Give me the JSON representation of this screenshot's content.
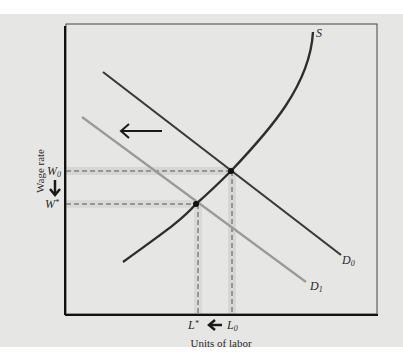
{
  "figure": {
    "type": "labor-market-diagram",
    "x_axis_label": "Units of labor",
    "y_axis_label": "Wage rate",
    "curves": [
      {
        "id": "S",
        "label": "S",
        "kind": "supply",
        "color": "#2e2e2e"
      },
      {
        "id": "D0",
        "label": "D",
        "subscript": "0",
        "kind": "demand-initial",
        "color": "#3a3a3a"
      },
      {
        "id": "D1",
        "label": "D",
        "subscript": "1",
        "kind": "demand-shifted",
        "color": "#9a9a9a"
      }
    ],
    "wage_labels": {
      "w0": {
        "base": "W",
        "sub": "0"
      },
      "wstar": {
        "base": "W",
        "sup": "*"
      }
    },
    "labor_labels": {
      "lstar": {
        "base": "L",
        "sup": "*"
      },
      "l0": {
        "base": "L",
        "sub": "0"
      }
    },
    "annotations": {
      "shift_arrow": "demand shifts left",
      "wage_arrow": "wage falls",
      "labor_arrow": "labor falls"
    },
    "equilibria": [
      {
        "name": "initial",
        "wage": "W0",
        "labor": "L0"
      },
      {
        "name": "new",
        "wage": "W*",
        "labor": "L*"
      }
    ],
    "colors": {
      "background": "#e6e6e4",
      "axis": "#1a1a1a",
      "supply": "#2e2e2e",
      "demand0": "#3a3a3a",
      "demand1": "#9a9a9a",
      "highlight": "#cfcfcf"
    }
  }
}
